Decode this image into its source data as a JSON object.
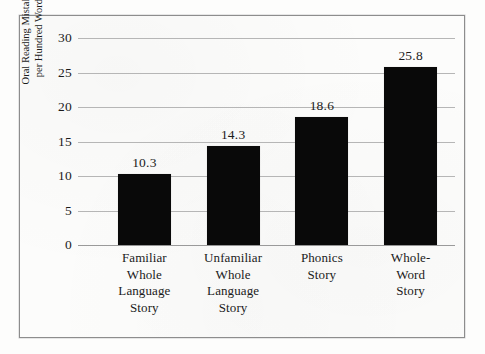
{
  "chart_data": {
    "type": "bar",
    "title": "",
    "subtitle": "",
    "xlabel": "",
    "ylabel_lines": [
      "Oral Reading Mistakes",
      "per Hundred Words"
    ],
    "ylabel": "Oral Reading Mistakes per Hundred Words",
    "categories": [
      "Familiar Whole Language Story",
      "Unfamiliar Whole Language Story",
      "Phonics Story",
      "Whole-Word Story"
    ],
    "category_lines": [
      [
        "Familiar",
        "Whole",
        "Language",
        "Story"
      ],
      [
        "Unfamiliar",
        "Whole",
        "Language",
        "Story"
      ],
      [
        "Phonics",
        "Story"
      ],
      [
        "Whole-",
        "Word",
        "Story"
      ]
    ],
    "values": [
      10.3,
      14.3,
      18.6,
      25.8
    ],
    "value_labels": [
      "10.3",
      "14.3",
      "18.6",
      "25.8"
    ],
    "ylim": [
      0,
      30
    ],
    "ytick_values": [
      0,
      5,
      10,
      15,
      20,
      25,
      30
    ],
    "ytick_labels": [
      "0",
      "5",
      "10",
      "15",
      "20",
      "25",
      "30"
    ],
    "grid": true,
    "legend": false,
    "legend_position": "none",
    "bar_color": "#090909",
    "gridline_color": "#b6b6b6",
    "axis_color": "#9a9a9a",
    "background_color": "#fcfcfb",
    "frame_color": "#8d8d8d",
    "text_color": "#1b1b1b"
  }
}
